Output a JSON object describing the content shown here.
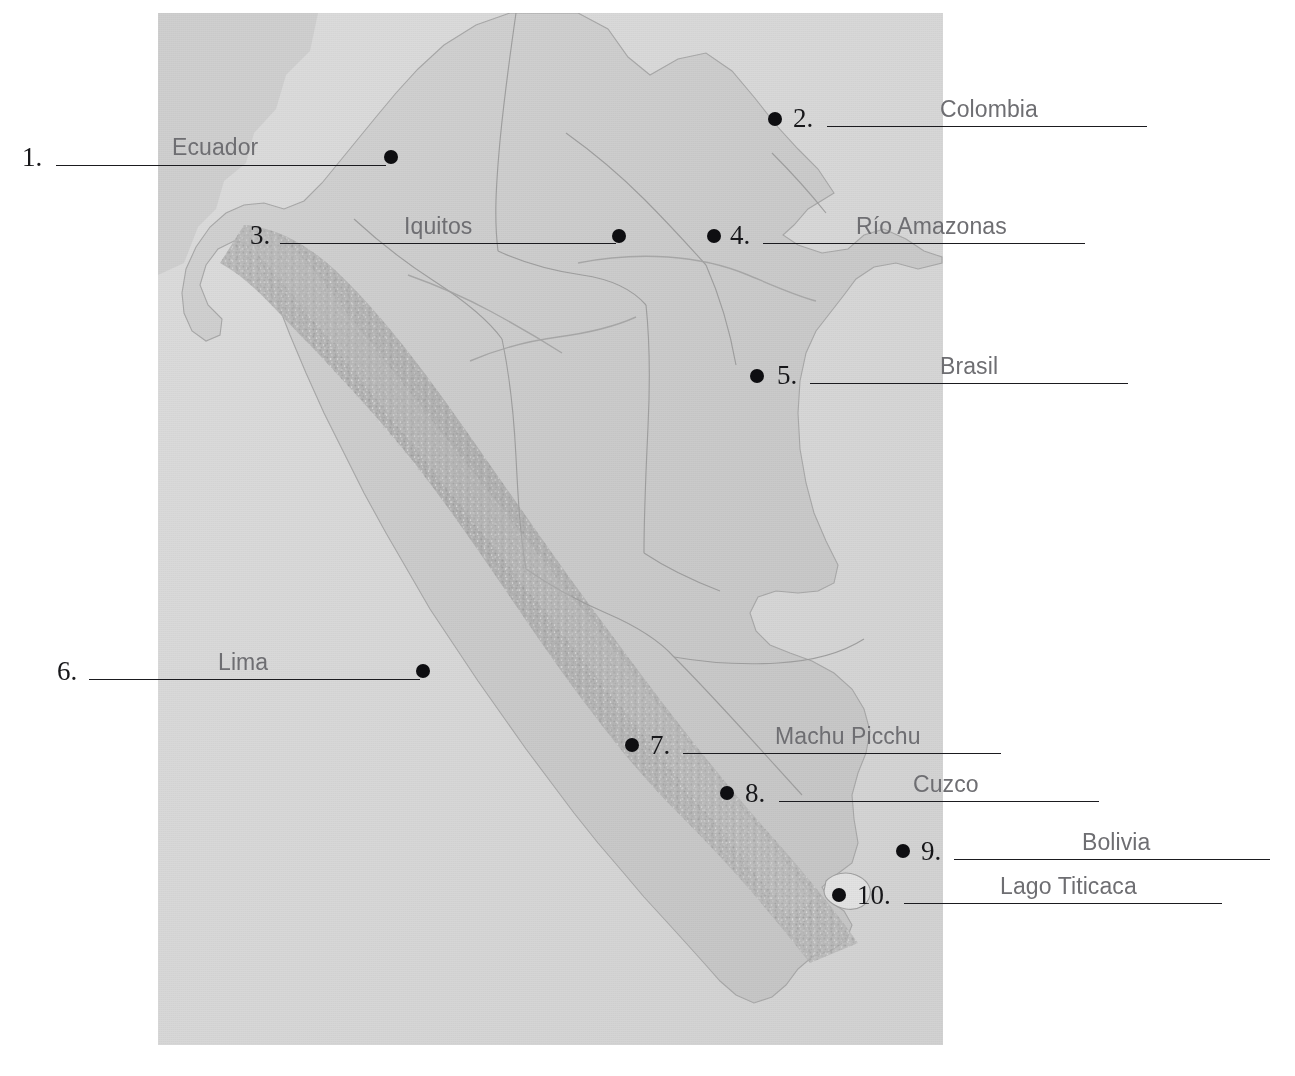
{
  "page": {
    "background_color": "#ffffff"
  },
  "map": {
    "name": "peru-relief-map",
    "panel": {
      "x": 158,
      "y": 13,
      "width": 785,
      "height": 1032
    },
    "colors": {
      "ocean": "#d9d9d9",
      "land": "#cfcfcf",
      "highland": "#bdbdbd",
      "neighbor_fill": "#d3d3d3",
      "border_line": "#9a9a9a",
      "lake": "#e4e4e4"
    }
  },
  "labels": [
    {
      "number": "1.",
      "name": "Ecuador",
      "dot": {
        "x": 391,
        "y": 157
      },
      "num_x": 22,
      "num_y": 144,
      "line_x": 56,
      "line_y": 165,
      "line_w": 330,
      "name_x": 172,
      "name_y": 136
    },
    {
      "number": "2.",
      "name": "Colombia",
      "dot": {
        "x": 775,
        "y": 119
      },
      "num_x": 793,
      "num_y": 105,
      "line_x": 827,
      "line_y": 126,
      "line_w": 320,
      "name_x": 940,
      "name_y": 98
    },
    {
      "number": "3.",
      "name": "Iquitos",
      "dot": {
        "x": 619,
        "y": 236
      },
      "num_x": 250,
      "num_y": 222,
      "line_x": 280,
      "line_y": 243,
      "line_w": 336,
      "name_x": 404,
      "name_y": 215
    },
    {
      "number": "4.",
      "name": "Río Amazonas",
      "dot": {
        "x": 714,
        "y": 236
      },
      "num_x": 730,
      "num_y": 222,
      "line_x": 763,
      "line_y": 243,
      "line_w": 322,
      "name_x": 856,
      "name_y": 215
    },
    {
      "number": "5.",
      "name": "Brasil",
      "dot": {
        "x": 757,
        "y": 376
      },
      "num_x": 777,
      "num_y": 362,
      "line_x": 810,
      "line_y": 383,
      "line_w": 318,
      "name_x": 940,
      "name_y": 355
    },
    {
      "number": "6.",
      "name": "Lima",
      "dot": {
        "x": 423,
        "y": 671
      },
      "num_x": 57,
      "num_y": 658,
      "line_x": 89,
      "line_y": 679,
      "line_w": 331,
      "name_x": 218,
      "name_y": 651
    },
    {
      "number": "7.",
      "name": "Machu Picchu",
      "dot": {
        "x": 632,
        "y": 745
      },
      "num_x": 650,
      "num_y": 732,
      "line_x": 683,
      "line_y": 753,
      "line_w": 318,
      "name_x": 775,
      "name_y": 725
    },
    {
      "number": "8.",
      "name": "Cuzco",
      "dot": {
        "x": 727,
        "y": 793
      },
      "num_x": 745,
      "num_y": 780,
      "line_x": 779,
      "line_y": 801,
      "line_w": 320,
      "name_x": 913,
      "name_y": 773
    },
    {
      "number": "9.",
      "name": "Bolivia",
      "dot": {
        "x": 903,
        "y": 851
      },
      "num_x": 921,
      "num_y": 838,
      "line_x": 954,
      "line_y": 859,
      "line_w": 316,
      "name_x": 1082,
      "name_y": 831
    },
    {
      "number": "10.",
      "name": "Lago Titicaca",
      "dot": {
        "x": 839,
        "y": 895
      },
      "num_x": 857,
      "num_y": 882,
      "line_x": 904,
      "line_y": 903,
      "line_w": 318,
      "name_x": 1000,
      "name_y": 875
    }
  ]
}
